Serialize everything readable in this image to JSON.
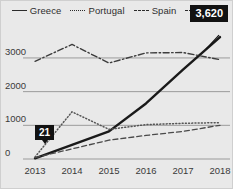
{
  "chart_data": {
    "type": "line",
    "title": "",
    "xlabel": "",
    "ylabel": "",
    "x": [
      2013,
      2014,
      2015,
      2016,
      2017,
      2018
    ],
    "categories": [
      "2013",
      "2014",
      "2015",
      "2016",
      "2017",
      "2018"
    ],
    "ylim": [
      0,
      3800
    ],
    "yticks": [
      0,
      1000,
      2000,
      3000
    ],
    "ytick_labels": [
      "0",
      "1000",
      "2000",
      "3000"
    ],
    "grid": true,
    "legend_position": "top",
    "series": [
      {
        "name": "Greece",
        "style": "solid",
        "color": "#1a1a1a",
        "values": [
          21,
          420,
          820,
          1650,
          2650,
          3620
        ]
      },
      {
        "name": "Portugal",
        "style": "dotted",
        "color": "#555555",
        "values": [
          60,
          1400,
          880,
          1020,
          1060,
          1080
        ]
      },
      {
        "name": "Spain",
        "style": "dashed",
        "color": "#4a4a4a",
        "values": [
          40,
          300,
          560,
          700,
          820,
          1000
        ]
      },
      {
        "name": "USA",
        "style": "dashdot",
        "color": "#3d3d3d",
        "values": [
          2900,
          3400,
          2850,
          3150,
          3160,
          2950
        ]
      }
    ],
    "annotations": [
      {
        "label": "21",
        "series": "Greece",
        "x": 2013,
        "y": 21
      },
      {
        "label": "3,620",
        "series": "Greece",
        "x": 2018,
        "y": 3620
      }
    ]
  },
  "legend": {
    "items": [
      {
        "label": "Greece",
        "style": "solid"
      },
      {
        "label": "Portugal",
        "style": "dotted"
      },
      {
        "label": "Spain",
        "style": "dashed"
      },
      {
        "label": "USA",
        "style": "dashdot"
      }
    ]
  },
  "axes": {
    "y_labels": [
      "3000",
      "2000",
      "1000",
      "0"
    ],
    "x_labels": [
      "2013",
      "2014",
      "2015",
      "2016",
      "2017",
      "2018"
    ]
  },
  "callouts": {
    "start_value": "21",
    "end_value": "3,620"
  },
  "colors": {
    "background": "#e9e9e9",
    "border": "#cfcfcf",
    "gridline": "#9b9b9b",
    "text": "#3a3a3a",
    "callout_bg": "#121212",
    "callout_text": "#ffffff",
    "line": "#1a1a1a"
  }
}
